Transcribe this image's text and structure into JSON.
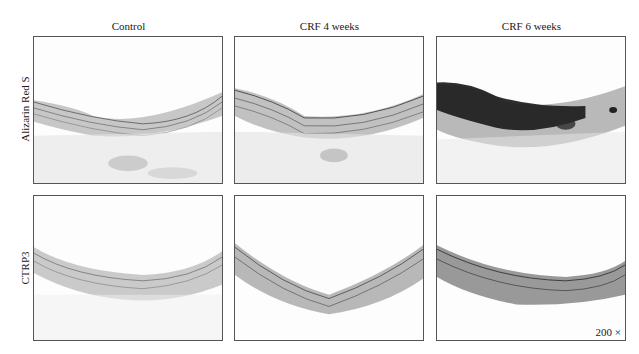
{
  "figure": {
    "columns": [
      {
        "label": "Control"
      },
      {
        "label": "CRF 4 weeks"
      },
      {
        "label": "CRF 6 weeks"
      }
    ],
    "rows": [
      {
        "label": "Alizarin Red S"
      },
      {
        "label": "CTRP3"
      }
    ],
    "panels": [
      {
        "row": "Alizarin Red S",
        "column": "Control",
        "staining": "light"
      },
      {
        "row": "Alizarin Red S",
        "column": "CRF 4 weeks",
        "staining": "light"
      },
      {
        "row": "Alizarin Red S",
        "column": "CRF 6 weeks",
        "staining": "heavy dark calcification"
      },
      {
        "row": "CTRP3",
        "column": "Control",
        "staining": "light"
      },
      {
        "row": "CTRP3",
        "column": "CRF 4 weeks",
        "staining": "moderate"
      },
      {
        "row": "CTRP3",
        "column": "CRF 6 weeks",
        "staining": "strong"
      }
    ],
    "magnification": "200 ×"
  }
}
